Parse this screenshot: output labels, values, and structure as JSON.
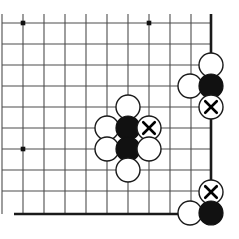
{
  "figure": {
    "board_style": "go-goban-corner",
    "width": 239,
    "height": 239,
    "background_color": "#ffffff"
  },
  "board": {
    "line_color": "#4d4d4d",
    "edge_color": "#1a1a1a",
    "star_point_color": "#111111",
    "spacing": 21,
    "x_lines": [
      2,
      23,
      44,
      65,
      86,
      107,
      128,
      149,
      170,
      191,
      211
    ],
    "y_lines": [
      23,
      44,
      65,
      86,
      107,
      128,
      149,
      170,
      191,
      214
    ],
    "edges": [
      {
        "name": "right-edge",
        "orientation": "vertical",
        "pos": 211,
        "from": 14,
        "to": 216
      },
      {
        "name": "bottom-edge",
        "orientation": "horizontal",
        "pos": 214,
        "from": 14,
        "to": 211
      }
    ],
    "star_points": [
      {
        "name": "star-point-top-left",
        "x": 23,
        "y": 23
      },
      {
        "name": "star-point-top-right",
        "x": 149,
        "y": 23
      },
      {
        "name": "star-point-left",
        "x": 23,
        "y": 149
      }
    ]
  },
  "stones": {
    "white_color": "#ffffff",
    "black_color": "#111111",
    "outline_color": "#1a1a1a",
    "radius": 12,
    "list": [
      {
        "name": "white-stone-center-top",
        "color": "white",
        "x": 128,
        "y": 107,
        "mark": ""
      },
      {
        "name": "white-stone-center-left-upper",
        "color": "white",
        "x": 107,
        "y": 128,
        "mark": ""
      },
      {
        "name": "black-stone-center-upper",
        "color": "black",
        "x": 128,
        "y": 128,
        "mark": ""
      },
      {
        "name": "white-stone-marked-center",
        "color": "white",
        "x": 149,
        "y": 128,
        "mark": "x"
      },
      {
        "name": "white-stone-center-left-lower",
        "color": "white",
        "x": 107,
        "y": 149,
        "mark": ""
      },
      {
        "name": "black-stone-center-lower",
        "color": "black",
        "x": 128,
        "y": 149,
        "mark": ""
      },
      {
        "name": "white-stone-center-right-lower",
        "color": "white",
        "x": 149,
        "y": 149,
        "mark": ""
      },
      {
        "name": "white-stone-center-bottom",
        "color": "white",
        "x": 128,
        "y": 170,
        "mark": ""
      },
      {
        "name": "white-stone-edge-top",
        "color": "white",
        "x": 211,
        "y": 65,
        "mark": ""
      },
      {
        "name": "white-stone-edge-inner",
        "color": "white",
        "x": 190,
        "y": 86,
        "mark": ""
      },
      {
        "name": "black-stone-edge-upper",
        "color": "black",
        "x": 211,
        "y": 86,
        "mark": ""
      },
      {
        "name": "white-stone-marked-edge",
        "color": "white",
        "x": 211,
        "y": 107,
        "mark": "x"
      },
      {
        "name": "white-stone-marked-corner",
        "color": "white",
        "x": 211,
        "y": 192,
        "mark": "x"
      },
      {
        "name": "white-stone-corner-inner",
        "color": "white",
        "x": 190,
        "y": 213,
        "mark": ""
      },
      {
        "name": "black-stone-corner",
        "color": "black",
        "x": 211,
        "y": 213,
        "mark": ""
      }
    ]
  }
}
